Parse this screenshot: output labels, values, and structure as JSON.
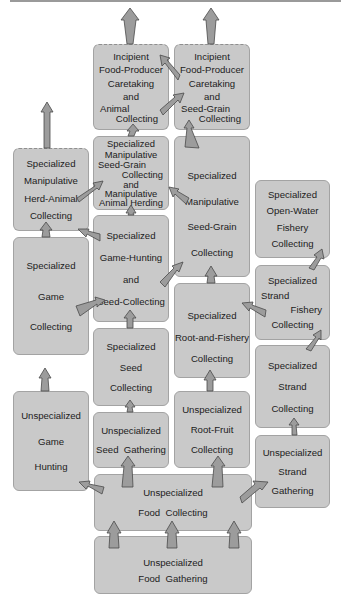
{
  "diagram": {
    "type": "evolutionary-stage-flowchart",
    "colors": {
      "box_fill": "#c9c9c9",
      "box_border": "#a3a3a3",
      "arrow_fill": "#9c9c9c",
      "arrow_stroke": "#4a4a4a",
      "text": "#1c1c1c"
    },
    "nodes": {
      "incipient_animal": {
        "lines": [
          "Incipient",
          "Food-Producer",
          "Caretaking",
          "and",
          "Animal",
          "Collecting"
        ],
        "dashed_top": true
      },
      "incipient_seed": {
        "lines": [
          "Incipient",
          "Food-Producer",
          "Caretaking",
          "and",
          "Seed-Grain",
          "Collecting"
        ],
        "dashed_top": true
      },
      "herd_animal": {
        "lines": [
          "Specialized",
          "Manipulative",
          "Herd-Animal",
          "Collecting"
        ],
        "dashed_top": true
      },
      "manip_seed_animal": {
        "lines": [
          "Specialized",
          "Manipulative",
          "Seed-Grain",
          "Collecting",
          "and",
          "Manipulative",
          "Animal Herding"
        ]
      },
      "manip_seed_grain": {
        "lines": [
          "Specialized",
          "Manipulative",
          "Seed-Grain",
          "Collecting"
        ]
      },
      "open_water": {
        "lines": [
          "Specialized",
          "Open-Water",
          "Fishery",
          "Collecting"
        ]
      },
      "game_collecting": {
        "lines": [
          "Specialized",
          "Game",
          "Collecting"
        ]
      },
      "game_seed": {
        "lines": [
          "Specialized",
          "Game-Hunting",
          "and",
          "Seed-Collecting"
        ]
      },
      "strand_fishery": {
        "lines": [
          "Specialized",
          "Strand",
          "Fishery",
          "Collecting"
        ]
      },
      "root_fishery": {
        "lines": [
          "Specialized",
          "Root-and-Fishery",
          "Collecting"
        ]
      },
      "seed_collecting": {
        "lines": [
          "Specialized",
          "Seed",
          "Collecting"
        ]
      },
      "strand_collecting": {
        "lines": [
          "Specialized",
          "Strand",
          "Collecting"
        ]
      },
      "game_hunting": {
        "lines": [
          "Unspecialized",
          "Game",
          "Hunting"
        ]
      },
      "seed_gathering": {
        "lines": [
          "Unspecialized",
          "Seed  Gathering"
        ]
      },
      "root_fruit": {
        "lines": [
          "Unspecialized",
          "Root-Fruit",
          "Collecting"
        ]
      },
      "strand_gathering": {
        "lines": [
          "Unspecialized",
          "Strand",
          "Gathering"
        ]
      },
      "food_collecting": {
        "lines": [
          "Unspecialized",
          "Food  Collecting"
        ]
      },
      "food_gathering": {
        "lines": [
          "Unspecialized",
          "Food  Gathering"
        ]
      }
    },
    "edges": [
      [
        "food_gathering",
        "food_collecting"
      ],
      [
        "food_collecting",
        "game_hunting"
      ],
      [
        "food_collecting",
        "seed_gathering"
      ],
      [
        "food_collecting",
        "root_fruit"
      ],
      [
        "food_collecting",
        "strand_gathering"
      ],
      [
        "game_hunting",
        "game_collecting"
      ],
      [
        "seed_gathering",
        "seed_collecting"
      ],
      [
        "root_fruit",
        "root_fishery"
      ],
      [
        "strand_gathering",
        "strand_collecting"
      ],
      [
        "strand_collecting",
        "strand_fishery"
      ],
      [
        "strand_fishery",
        "open_water"
      ],
      [
        "strand_fishery",
        "root_fishery"
      ],
      [
        "seed_collecting",
        "game_seed"
      ],
      [
        "game_collecting",
        "game_seed"
      ],
      [
        "game_collecting",
        "herd_animal"
      ],
      [
        "game_seed",
        "herd_animal"
      ],
      [
        "game_seed",
        "manip_seed_animal"
      ],
      [
        "game_seed",
        "manip_seed_grain"
      ],
      [
        "root_fishery",
        "manip_seed_grain"
      ],
      [
        "herd_animal",
        "manip_seed_animal"
      ],
      [
        "manip_seed_grain",
        "manip_seed_animal"
      ],
      [
        "manip_seed_animal",
        "incipient_animal"
      ],
      [
        "manip_seed_grain",
        "incipient_seed"
      ],
      [
        "incipient_seed",
        "incipient_animal"
      ],
      [
        "incipient_animal",
        "incipient_seed"
      ]
    ]
  }
}
